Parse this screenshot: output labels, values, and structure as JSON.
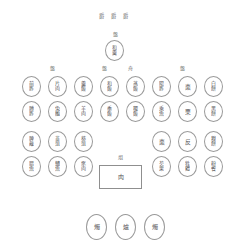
{
  "diagram": {
    "background_color": "#ffffff",
    "stroke_color": "#9a9a9a",
    "text_color": "#555555"
  },
  "header": {
    "marks": [
      "爵",
      "爵",
      "爵"
    ]
  },
  "center_top": {
    "caption": "盤",
    "label_top": "和",
    "label_bottom": "羹"
  },
  "group_captions": [
    {
      "text": "盤",
      "column": 2
    },
    {
      "text": "盤",
      "column": 4
    },
    {
      "text": "舟",
      "column": 5
    },
    {
      "text": "盤",
      "column": 7
    }
  ],
  "rows": [
    {
      "name": "row-1",
      "cells": [
        {
          "top": "前",
          "bottom": "胙"
        },
        {
          "top": "片",
          "bottom": "肉"
        },
        {
          "top": "羹",
          "bottom": "飯"
        },
        {
          "top": "和",
          "bottom": "飯"
        },
        {
          "top": "蒸",
          "bottom": "飯"
        },
        {
          "top": "陽",
          "bottom": "胙"
        },
        {
          "top": "棗",
          "bottom": ""
        },
        {
          "top": "白",
          "bottom": "餅"
        }
      ]
    },
    {
      "name": "row-2",
      "cells": [
        {
          "top": "膊",
          "bottom": "胙"
        },
        {
          "top": "兔",
          "bottom": "醢"
        },
        {
          "top": "羊",
          "bottom": "肉"
        },
        {
          "top": "黍",
          "bottom": "飯"
        },
        {
          "top": "稷",
          "bottom": "飯"
        },
        {
          "top": "乘",
          "bottom": "魚"
        },
        {
          "top": "栗",
          "bottom": ""
        },
        {
          "top": "黑",
          "bottom": "餅"
        }
      ]
    },
    {
      "name": "row-3",
      "cells": [
        {
          "top": "脾",
          "bottom": "胾"
        },
        {
          "top": "韭",
          "bottom": "菹"
        },
        {
          "top": "葵",
          "bottom": "菹"
        },
        null,
        null,
        {
          "top": "棗",
          "bottom": ""
        },
        {
          "top": "反",
          "bottom": ""
        },
        {
          "top": "糗",
          "bottom": "餅"
        }
      ]
    },
    {
      "name": "row-4",
      "cells": [
        {
          "top": "腊",
          "bottom": "魚"
        },
        {
          "top": "鱐",
          "bottom": "魚"
        },
        {
          "top": "豕",
          "bottom": "肉"
        },
        null,
        null,
        {
          "top": "芡",
          "bottom": "栗"
        },
        {
          "top": "牲",
          "bottom": "體"
        },
        {
          "top": "粉",
          "bottom": "餈"
        }
      ]
    }
  ],
  "center_table": {
    "caption": "俎",
    "label": "肉"
  },
  "vessels": [
    {
      "label": "燭"
    },
    {
      "label": "爐"
    },
    {
      "label": "燭"
    }
  ]
}
